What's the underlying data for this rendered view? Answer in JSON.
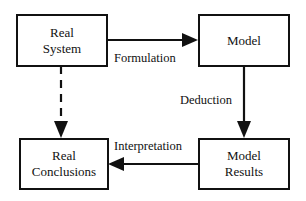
{
  "diagram": {
    "nodes": [
      {
        "id": "real_system",
        "line1": "Real",
        "line2": "System"
      },
      {
        "id": "model",
        "line1": "Model",
        "line2": ""
      },
      {
        "id": "real_conclusions",
        "line1": "Real",
        "line2": "Conclusions"
      },
      {
        "id": "model_results",
        "line1": "Model",
        "line2": "Results"
      }
    ],
    "edges": [
      {
        "from": "real_system",
        "to": "model",
        "label": "Formulation",
        "style": "solid"
      },
      {
        "from": "model",
        "to": "model_results",
        "label": "Deduction",
        "style": "solid"
      },
      {
        "from": "model_results",
        "to": "real_conclusions",
        "label": "Interpretation",
        "style": "solid"
      },
      {
        "from": "real_system",
        "to": "real_conclusions",
        "label": "",
        "style": "dashed"
      }
    ],
    "colors": {
      "stroke": "#111111",
      "background": "#ffffff"
    }
  }
}
